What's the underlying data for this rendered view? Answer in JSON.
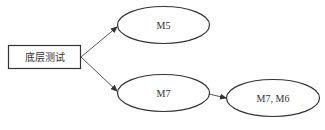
{
  "diagram": {
    "root": {
      "label": "底层测试"
    },
    "nodes": [
      {
        "id": "m5",
        "label": "M5"
      },
      {
        "id": "m7",
        "label": "M7"
      },
      {
        "id": "m7m6",
        "label": "M7, M6"
      }
    ],
    "edges": [
      {
        "from": "root",
        "to": "m5"
      },
      {
        "from": "root",
        "to": "m7"
      },
      {
        "from": "m7",
        "to": "m7m6"
      }
    ],
    "colors": {
      "stroke": "#333333",
      "background": "#ffffff"
    }
  }
}
